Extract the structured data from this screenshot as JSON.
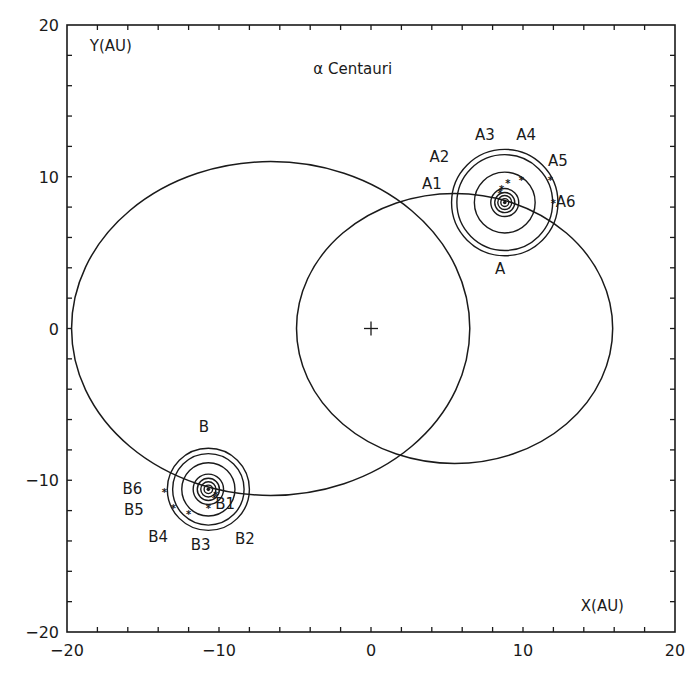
{
  "chart_data": {
    "type": "scatter",
    "title": "α Centauri",
    "xlabel": "X(AU)",
    "ylabel": "Y(AU)",
    "xlim": [
      -20,
      20
    ],
    "ylim": [
      -20,
      20
    ],
    "x_ticks": [
      -20,
      -10,
      0,
      10,
      20
    ],
    "y_ticks": [
      -20,
      -10,
      0,
      10,
      20
    ],
    "x_tick_labels": [
      "−20",
      "−10",
      "0",
      "10",
      "20"
    ],
    "y_tick_labels": [
      "−20",
      "−10",
      "0",
      "10",
      "20"
    ],
    "minor_tick_step": 2,
    "grid": false,
    "legend": null,
    "center_of_mass": {
      "x": 0,
      "y": 0,
      "marker": "+"
    },
    "orbits": [
      {
        "name": "Orbit of B (about barycenter)",
        "cx": -6.6,
        "cy": 0.0,
        "rx": 13.1,
        "ry": 11.0
      },
      {
        "name": "Orbit of A (about barycenter)",
        "cx": 5.5,
        "cy": 0.0,
        "rx": 10.4,
        "ry": 8.9
      }
    ],
    "systems": [
      {
        "name": "A",
        "center": {
          "x": 8.8,
          "y": 8.3
        },
        "ring_radii_au": [
          3.5,
          3.15,
          2.0,
          0.92,
          0.66,
          0.46,
          0.26
        ],
        "label": {
          "text": "A",
          "x": 8.5,
          "y": 3.6
        },
        "points": [
          {
            "name": "A1",
            "x": 8.5,
            "y": 8.9,
            "label_x": 4.0,
            "label_y": 9.2
          },
          {
            "name": "A2",
            "x": 8.6,
            "y": 9.2,
            "label_x": 4.5,
            "label_y": 11.0
          },
          {
            "name": "A3",
            "x": 9.0,
            "y": 9.6,
            "label_x": 7.5,
            "label_y": 12.4
          },
          {
            "name": "A4",
            "x": 9.9,
            "y": 9.8,
            "label_x": 10.2,
            "label_y": 12.4
          },
          {
            "name": "A5",
            "x": 11.8,
            "y": 9.8,
            "label_x": 12.3,
            "label_y": 10.7
          },
          {
            "name": "A6",
            "x": 12.0,
            "y": 8.3,
            "label_x": 12.8,
            "label_y": 8.0
          }
        ]
      },
      {
        "name": "B",
        "center": {
          "x": -10.7,
          "y": -10.6
        },
        "ring_radii_au": [
          2.7,
          2.35,
          1.75,
          1.0,
          0.73,
          0.5,
          0.28
        ],
        "label": {
          "text": "B",
          "x": -11.0,
          "y": -6.8
        },
        "points": [
          {
            "name": "B1",
            "x": -10.2,
            "y": -11.0,
            "label_x": -9.6,
            "label_y": -11.9
          },
          {
            "name": "B2",
            "x": -10.3,
            "y": -11.2,
            "label_x": -8.3,
            "label_y": -14.2
          },
          {
            "name": "B3",
            "x": -10.7,
            "y": -11.8,
            "label_x": -11.2,
            "label_y": -14.6
          },
          {
            "name": "B4",
            "x": -12.0,
            "y": -12.2,
            "label_x": -14.0,
            "label_y": -14.1
          },
          {
            "name": "B5",
            "x": -13.0,
            "y": -11.8,
            "label_x": -15.6,
            "label_y": -12.3
          },
          {
            "name": "B6",
            "x": -13.6,
            "y": -10.8,
            "label_x": -15.7,
            "label_y": -10.9
          }
        ]
      }
    ]
  }
}
